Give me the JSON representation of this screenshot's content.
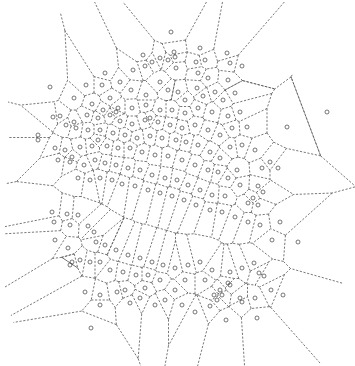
{
  "diagram": {
    "type": "voronoi",
    "width": 355,
    "height": 366,
    "edge_color": "#555555",
    "site_color": "#555555",
    "site_radius": 2,
    "clip_polygon": [
      [
        68,
        2
      ],
      [
        300,
        2
      ],
      [
        300,
        20
      ],
      [
        290,
        90
      ],
      [
        355,
        10
      ],
      [
        355,
        250
      ],
      [
        320,
        340
      ],
      [
        320,
        366
      ],
      [
        30,
        366
      ],
      [
        5,
        300
      ],
      [
        5,
        200
      ],
      [
        8,
        135
      ],
      [
        8,
        80
      ],
      [
        68,
        2
      ]
    ],
    "sites": [
      [
        171,
        32
      ],
      [
        174,
        52
      ],
      [
        143,
        55
      ],
      [
        160,
        58
      ],
      [
        200,
        48
      ],
      [
        227,
        53
      ],
      [
        242,
        66
      ],
      [
        230,
        63
      ],
      [
        198,
        73
      ],
      [
        145,
        66
      ],
      [
        175,
        57
      ],
      [
        152,
        62
      ],
      [
        168,
        60
      ],
      [
        176,
        68
      ],
      [
        196,
        62
      ],
      [
        205,
        60
      ],
      [
        208,
        78
      ],
      [
        228,
        80
      ],
      [
        105,
        73
      ],
      [
        133,
        70
      ],
      [
        120,
        82
      ],
      [
        102,
        85
      ],
      [
        50,
        87
      ],
      [
        86,
        85
      ],
      [
        131,
        90
      ],
      [
        74,
        98
      ],
      [
        110,
        98
      ],
      [
        146,
        95
      ],
      [
        160,
        82
      ],
      [
        168,
        90
      ],
      [
        178,
        92
      ],
      [
        185,
        100
      ],
      [
        197,
        88
      ],
      [
        203,
        96
      ],
      [
        215,
        92
      ],
      [
        223,
        100
      ],
      [
        235,
        93
      ],
      [
        240,
        112
      ],
      [
        228,
        116
      ],
      [
        212,
        112
      ],
      [
        198,
        108
      ],
      [
        185,
        113
      ],
      [
        172,
        110
      ],
      [
        160,
        110
      ],
      [
        146,
        105
      ],
      [
        132,
        108
      ],
      [
        118,
        108
      ],
      [
        103,
        110
      ],
      [
        92,
        104
      ],
      [
        60,
        116
      ],
      [
        53,
        117
      ],
      [
        66,
        125
      ],
      [
        74,
        122
      ],
      [
        87,
        115
      ],
      [
        98,
        118
      ],
      [
        110,
        115
      ],
      [
        116,
        112
      ],
      [
        120,
        121
      ],
      [
        132,
        124
      ],
      [
        145,
        120
      ],
      [
        150,
        118
      ],
      [
        158,
        122
      ],
      [
        170,
        125
      ],
      [
        182,
        128
      ],
      [
        195,
        125
      ],
      [
        208,
        130
      ],
      [
        220,
        135
      ],
      [
        232,
        128
      ],
      [
        247,
        127
      ],
      [
        242,
        145
      ],
      [
        255,
        150
      ],
      [
        270,
        162
      ],
      [
        287,
        127
      ],
      [
        230,
        147
      ],
      [
        220,
        158
      ],
      [
        210,
        152
      ],
      [
        198,
        145
      ],
      [
        186,
        142
      ],
      [
        176,
        140
      ],
      [
        162,
        138
      ],
      [
        150,
        136
      ],
      [
        137,
        138
      ],
      [
        125,
        135
      ],
      [
        113,
        133
      ],
      [
        100,
        130
      ],
      [
        88,
        130
      ],
      [
        76,
        128
      ],
      [
        38,
        135
      ],
      [
        38,
        140
      ],
      [
        55,
        148
      ],
      [
        58,
        160
      ],
      [
        70,
        162
      ],
      [
        72,
        157
      ],
      [
        65,
        150
      ],
      [
        80,
        147
      ],
      [
        92,
        146
      ],
      [
        98,
        140
      ],
      [
        107,
        146
      ],
      [
        118,
        148
      ],
      [
        130,
        148
      ],
      [
        142,
        152
      ],
      [
        155,
        155
      ],
      [
        168,
        156
      ],
      [
        182,
        160
      ],
      [
        195,
        165
      ],
      [
        208,
        170
      ],
      [
        218,
        172
      ],
      [
        228,
        178
      ],
      [
        240,
        185
      ],
      [
        253,
        198
      ],
      [
        263,
        192
      ],
      [
        258,
        205
      ],
      [
        248,
        203
      ],
      [
        258,
        186
      ],
      [
        237,
        170
      ],
      [
        262,
        168
      ],
      [
        278,
        168
      ],
      [
        225,
        196
      ],
      [
        212,
        195
      ],
      [
        200,
        190
      ],
      [
        188,
        185
      ],
      [
        177,
        180
      ],
      [
        165,
        178
      ],
      [
        152,
        175
      ],
      [
        140,
        170
      ],
      [
        128,
        168
      ],
      [
        116,
        165
      ],
      [
        105,
        163
      ],
      [
        95,
        160
      ],
      [
        84,
        165
      ],
      [
        78,
        178
      ],
      [
        90,
        180
      ],
      [
        100,
        178
      ],
      [
        112,
        180
      ],
      [
        122,
        184
      ],
      [
        135,
        186
      ],
      [
        148,
        190
      ],
      [
        160,
        193
      ],
      [
        172,
        196
      ],
      [
        184,
        200
      ],
      [
        196,
        205
      ],
      [
        210,
        210
      ],
      [
        222,
        212
      ],
      [
        235,
        217
      ],
      [
        248,
        222
      ],
      [
        260,
        225
      ],
      [
        280,
        222
      ],
      [
        272,
        240
      ],
      [
        298,
        242
      ],
      [
        327,
        112
      ],
      [
        52,
        212
      ],
      [
        54,
        222
      ],
      [
        67,
        214
      ],
      [
        70,
        225
      ],
      [
        78,
        215
      ],
      [
        68,
        248
      ],
      [
        72,
        262
      ],
      [
        70,
        265
      ],
      [
        55,
        240
      ],
      [
        88,
        226
      ],
      [
        94,
        232
      ],
      [
        96,
        242
      ],
      [
        105,
        245
      ],
      [
        116,
        250
      ],
      [
        128,
        255
      ],
      [
        140,
        258
      ],
      [
        152,
        262
      ],
      [
        163,
        265
      ],
      [
        175,
        268
      ],
      [
        188,
        265
      ],
      [
        200,
        262
      ],
      [
        212,
        270
      ],
      [
        220,
        290
      ],
      [
        230,
        272
      ],
      [
        242,
        268
      ],
      [
        254,
        263
      ],
      [
        264,
        276
      ],
      [
        271,
        290
      ],
      [
        255,
        298
      ],
      [
        242,
        302
      ],
      [
        230,
        285
      ],
      [
        222,
        295
      ],
      [
        214,
        295
      ],
      [
        217,
        300
      ],
      [
        205,
        280
      ],
      [
        185,
        280
      ],
      [
        175,
        290
      ],
      [
        160,
        280
      ],
      [
        148,
        275
      ],
      [
        136,
        275
      ],
      [
        123,
        272
      ],
      [
        110,
        270
      ],
      [
        100,
        262
      ],
      [
        90,
        262
      ],
      [
        80,
        260
      ],
      [
        85,
        292
      ],
      [
        100,
        305
      ],
      [
        100,
        295
      ],
      [
        91,
        328
      ],
      [
        117,
        292
      ],
      [
        125,
        290
      ],
      [
        130,
        303
      ],
      [
        140,
        298
      ],
      [
        145,
        288
      ],
      [
        155,
        305
      ],
      [
        165,
        300
      ],
      [
        182,
        305
      ],
      [
        195,
        312
      ],
      [
        210,
        306
      ],
      [
        226,
        320
      ],
      [
        257,
        318
      ],
      [
        283,
        295
      ],
      [
        240,
        298
      ],
      [
        228,
        283
      ],
      [
        259,
        273
      ]
    ]
  }
}
